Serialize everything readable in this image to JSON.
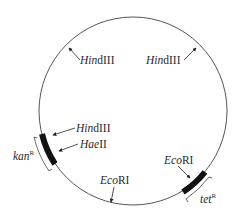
{
  "diagram": {
    "type": "plasmid-map",
    "colors": {
      "line": "#555555",
      "marker": "#111111",
      "text": "#2a2a2a",
      "background": "#ffffff"
    },
    "sites": [
      {
        "enzyme_italic": "Hin",
        "enzyme_roman": "dIII",
        "position": "upper-left"
      },
      {
        "enzyme_italic": "Hin",
        "enzyme_roman": "dIII",
        "position": "upper-right"
      },
      {
        "enzyme_italic": "Hin",
        "enzyme_roman": "dIII",
        "position": "left, in kanR"
      },
      {
        "enzyme_italic": "Hae",
        "enzyme_roman": "II",
        "position": "left, in kanR"
      },
      {
        "enzyme_italic": "Eco",
        "enzyme_roman": "RI",
        "position": "bottom"
      },
      {
        "enzyme_italic": "Eco",
        "enzyme_roman": "RI",
        "position": "lower-right, in tetR"
      }
    ],
    "genes": [
      {
        "name": "kan",
        "superscript": "R",
        "position": "left"
      },
      {
        "name": "tet",
        "superscript": "R",
        "position": "lower-right"
      }
    ]
  }
}
